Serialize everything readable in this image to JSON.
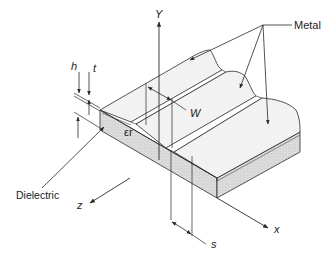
{
  "diagram": {
    "labels": {
      "metal": "Metal",
      "dielectric": "Dielectric",
      "permittivity": "εr",
      "axis_y": "Y",
      "axis_x": "x",
      "axis_z": "z",
      "dim_h": "h",
      "dim_t": "t",
      "dim_w": "W",
      "dim_s": "s"
    },
    "colors": {
      "line": "#2a2a2a",
      "dielectric_fill": "#d9d9d9",
      "metal_fill": "#f2f2f2",
      "background": "#ffffff"
    }
  }
}
